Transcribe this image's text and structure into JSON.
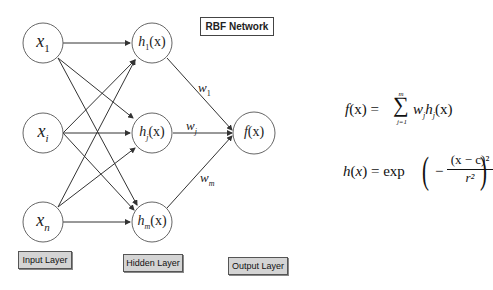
{
  "title": "RBF Network",
  "layers": {
    "input": {
      "label": "Input Layer",
      "nodes": [
        {
          "var": "x",
          "sub": "1"
        },
        {
          "var": "x",
          "sub": "i"
        },
        {
          "var": "x",
          "sub": "n"
        }
      ]
    },
    "hidden": {
      "label": "Hidden Layer",
      "nodes": [
        {
          "var": "h",
          "sub": "1",
          "arg": "(x)"
        },
        {
          "var": "h",
          "sub": "j",
          "arg": "(x)"
        },
        {
          "var": "h",
          "sub": "m",
          "arg": "(x)"
        }
      ]
    },
    "output": {
      "label": "Output Layer",
      "nodes": [
        {
          "var": "f",
          "arg": "(x)"
        }
      ]
    }
  },
  "weights": [
    {
      "var": "w",
      "sub": "1"
    },
    {
      "var": "w",
      "sub": "j"
    },
    {
      "var": "w",
      "sub": "m"
    }
  ],
  "formulas": {
    "output": {
      "lhs": "f(x) =",
      "sum_upper": "m",
      "sum_lower": "j=1",
      "sum_symbol": "∑",
      "term": "w",
      "term_sub": "j",
      "term2": "h",
      "term2_sub": "j",
      "term2_arg": "(x)"
    },
    "rbf": {
      "lhs": "h(x) = exp",
      "minus": "−",
      "numerator": "(x − c)²",
      "denominator": "r²"
    }
  }
}
